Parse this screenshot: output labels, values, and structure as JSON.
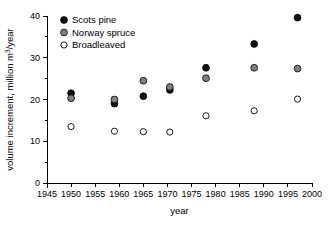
{
  "chart_data": {
    "type": "scatter",
    "title": "",
    "xlabel": "year",
    "ylabel": "volume increment, million m³/year",
    "ylabel_parts": {
      "pre": "volume increment, million m",
      "sup": "3",
      "post": "/year"
    },
    "xlim": [
      1945,
      2000
    ],
    "ylim": [
      0,
      40
    ],
    "xticks": [
      1945,
      1950,
      1955,
      1960,
      1965,
      1970,
      1975,
      1980,
      1985,
      1990,
      1995,
      2000
    ],
    "yticks": [
      0,
      10,
      20,
      30,
      40
    ],
    "y_minor_ticks": [
      5,
      15,
      25,
      35
    ],
    "xtick_labels": [
      "1945",
      "1950",
      "1955",
      "1960",
      "1965",
      "1970",
      "1975",
      "1980",
      "1985",
      "1990",
      "1995",
      "2000"
    ],
    "ytick_labels": [
      "0",
      "10",
      "20",
      "30",
      "40"
    ],
    "grid": false,
    "legend_position": "top-left",
    "series": [
      {
        "name": "Scots pine",
        "marker": "filled-circle",
        "color": "#111111",
        "x": [
          1950,
          1959,
          1965,
          1970.5,
          1978,
          1988,
          1997
        ],
        "values": [
          21.5,
          19.0,
          20.8,
          22.3,
          27.6,
          33.3,
          39.6
        ]
      },
      {
        "name": "Norway spruce",
        "marker": "filled-circle",
        "color": "#808080",
        "x": [
          1950,
          1959,
          1965,
          1970.5,
          1978,
          1988,
          1997
        ],
        "values": [
          20.3,
          20.0,
          24.5,
          23.0,
          25.1,
          27.6,
          27.4
        ]
      },
      {
        "name": "Broadleaved",
        "marker": "open-circle",
        "color": "#ffffff",
        "x": [
          1950,
          1959,
          1965,
          1970.5,
          1978,
          1988,
          1997
        ],
        "values": [
          13.5,
          12.4,
          12.3,
          12.2,
          16.1,
          17.3,
          20.1
        ]
      }
    ]
  },
  "legend": {
    "items": [
      {
        "label": "Scots pine",
        "marker": "filled-circle",
        "color": "#111111"
      },
      {
        "label": "Norway spruce",
        "marker": "filled-circle",
        "color": "#808080"
      },
      {
        "label": "Broadleaved",
        "marker": "open-circle",
        "color": "#ffffff"
      }
    ]
  },
  "axes": {
    "x_title": "year",
    "y_title": "volume increment, million m3/year"
  }
}
